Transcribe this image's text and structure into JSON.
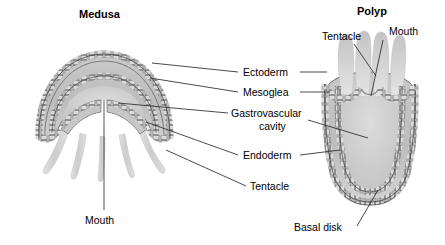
{
  "figure": {
    "background_color": "#ffffff",
    "line_color": "#2b2b2b",
    "text_color": "#000000"
  },
  "headings": {
    "medusa": "Medusa",
    "polyp": "Polyp"
  },
  "center_labels": [
    {
      "id": "ectoderm",
      "text": "Ectoderm"
    },
    {
      "id": "mesoglea",
      "text": "Mesoglea"
    },
    {
      "id": "gastrovascular",
      "text": "Gastrovascular"
    },
    {
      "id": "cavity",
      "text": "cavity"
    },
    {
      "id": "endoderm",
      "text": "Endoderm"
    },
    {
      "id": "tentacle_medusa",
      "text": "Tentacle"
    }
  ],
  "medusa_labels": [
    {
      "id": "mouth_medusa",
      "text": "Mouth"
    }
  ],
  "polyp_labels": [
    {
      "id": "tentacle_polyp",
      "text": "Tentacle"
    },
    {
      "id": "mouth_polyp",
      "text": "Mouth"
    },
    {
      "id": "basal_disk",
      "text": "Basal disk"
    }
  ],
  "anatomy_colors": {
    "mesoglea_fill": "#b9b9b9",
    "cell_layer_fill": "#cfcfcf",
    "cell_outline": "#4a4a4a",
    "cavity_fill": "#cdcdcd",
    "tentacle_fill": "#d6d6d6",
    "outline": "#3a3a3a"
  }
}
